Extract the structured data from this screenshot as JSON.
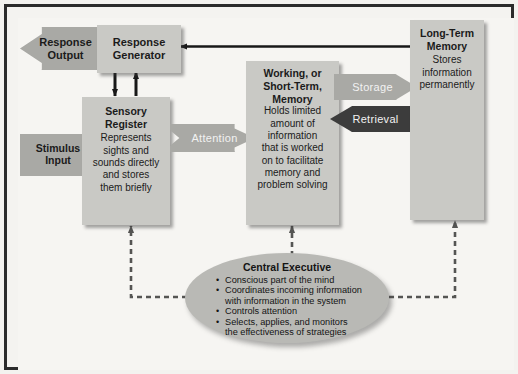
{
  "diagram": {
    "colors": {
      "frame_border": "#2b2b2b",
      "page_background": "#f4f3f0",
      "box_fill": "#c9c9c5",
      "arrow_fill": "#a9a9a5",
      "retrieval_fill": "#3c3c3c",
      "oval_fill": "#b9b9b5",
      "text": "#1b1b1b"
    },
    "nodes": {
      "response_output": {
        "label": "Response\nOutput",
        "shape": "left-chevron"
      },
      "response_generator": {
        "title": "Response\nGenerator",
        "shape": "box"
      },
      "stimulus_input": {
        "label": "Stimulus\nInput",
        "shape": "right-chevron"
      },
      "sensory_register": {
        "title": "Sensory\nRegister",
        "body": "Represents\nsights and\nsounds directly\nand stores\nthem briefly",
        "shape": "box"
      },
      "attention": {
        "label": "Attention",
        "shape": "right-chevron"
      },
      "working_memory": {
        "title": "Working, or\nShort-Term,\nMemory",
        "body": "Holds limited\namount of\ninformation\nthat is worked\non to facilitate\nmemory and\nproblem solving",
        "shape": "box"
      },
      "storage": {
        "label": "Storage",
        "shape": "right-chevron"
      },
      "retrieval": {
        "label": "Retrieval",
        "shape": "left-chevron"
      },
      "long_term_memory": {
        "title": "Long-Term\nMemory",
        "body": "Stores\ninformation\npermanently",
        "shape": "box"
      },
      "central_executive": {
        "title": "Central Executive",
        "bullets": [
          "Conscious part of the mind",
          "Coordinates incoming information\nwith information in the system",
          "Controls attention",
          "Selects, applies, and monitors\nthe effectiveness of strategies"
        ],
        "shape": "oval"
      }
    },
    "connectors": [
      {
        "name": "ltm-to-response-generator",
        "style": "solid",
        "direction": "left"
      },
      {
        "name": "response-generator-to-sensory-register",
        "style": "solid",
        "direction": "down"
      },
      {
        "name": "sensory-register-to-response-generator",
        "style": "solid",
        "direction": "up"
      },
      {
        "name": "central-executive-to-sensory-register",
        "style": "dashed",
        "direction": "up"
      },
      {
        "name": "central-executive-to-working-memory",
        "style": "dashed",
        "direction": "up"
      },
      {
        "name": "central-executive-to-long-term-memory",
        "style": "dashed",
        "direction": "up"
      }
    ]
  }
}
